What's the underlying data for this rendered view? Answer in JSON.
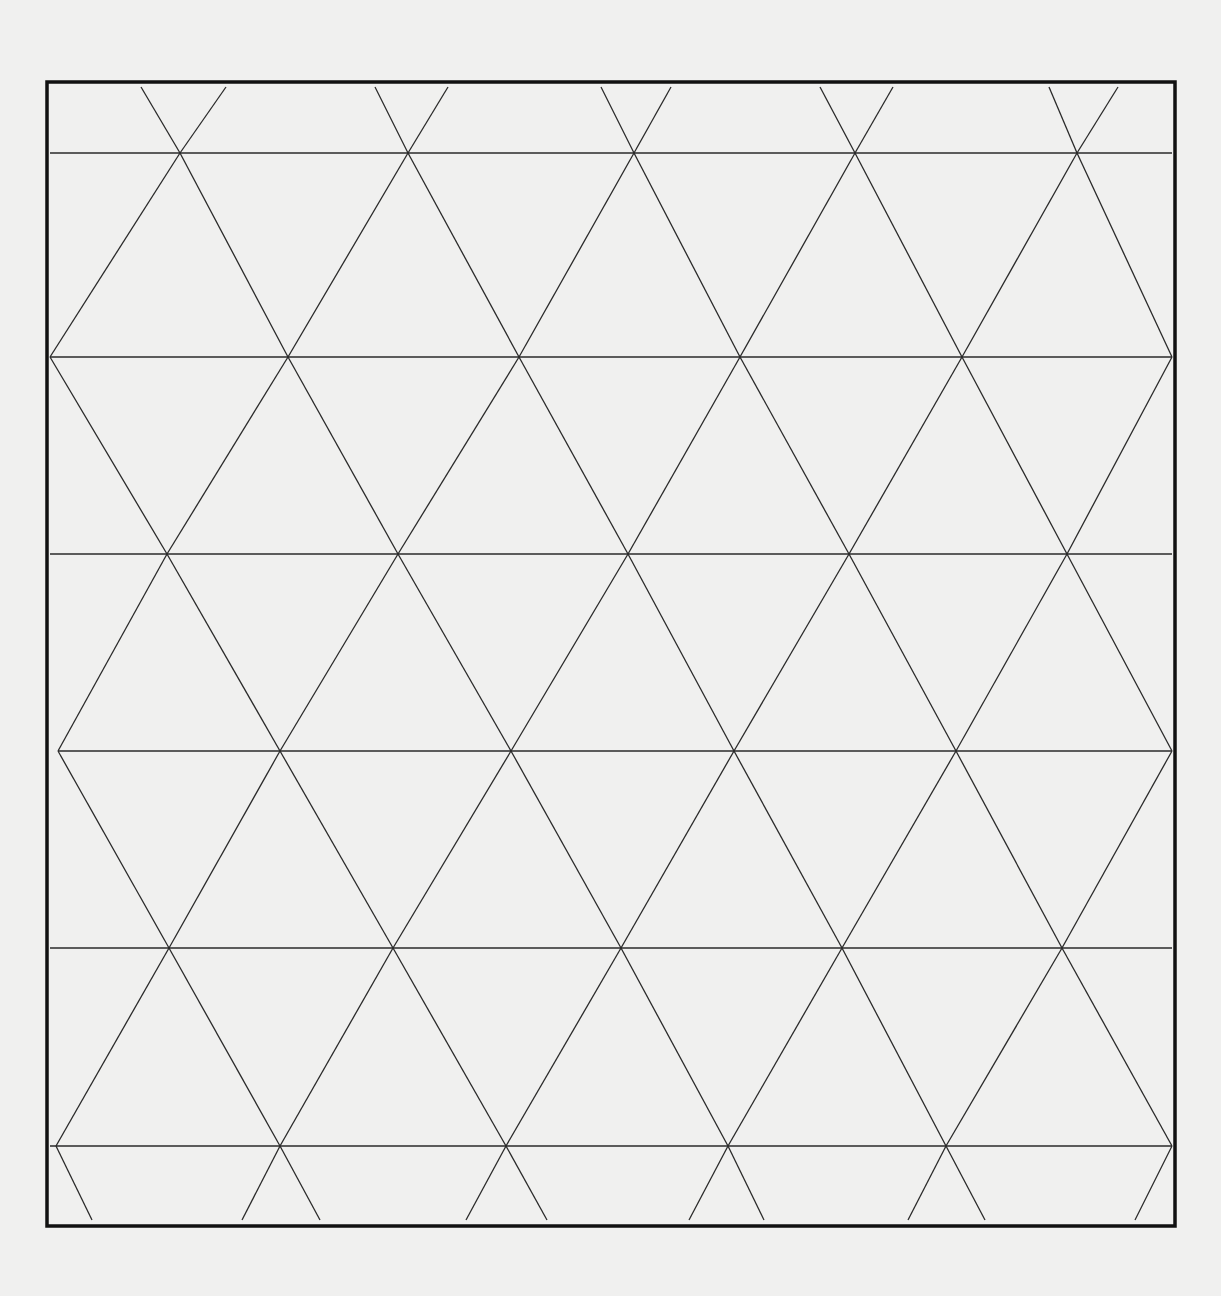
{
  "document": {
    "title": "Triangular grid paper",
    "paper_color": "#f0f0ef",
    "line_color": "#2a2a2a",
    "frame_color": "#111111"
  },
  "frame": {
    "x1": 47,
    "y1": 82,
    "x2": 1175,
    "y2": 1226,
    "stroke_width": 3.5
  },
  "grid": {
    "horizontal_lines": [
      {
        "y": 153,
        "x1": 50,
        "x2": 1172
      },
      {
        "y": 357,
        "x1": 50,
        "x2": 1172
      },
      {
        "y": 554,
        "x1": 50,
        "x2": 1172
      },
      {
        "y": 751,
        "x1": 58,
        "x2": 1172
      },
      {
        "y": 948,
        "x1": 50,
        "x2": 1172
      },
      {
        "y": 1146,
        "x1": 50,
        "x2": 1172
      }
    ],
    "vertex_rows": [
      {
        "y": 87,
        "x": [
          141,
          226,
          375,
          448,
          601,
          671,
          820,
          893,
          1049,
          1118
        ]
      },
      {
        "y": 153,
        "x": [
          180,
          408,
          634,
          855,
          1077
        ]
      },
      {
        "y": 357,
        "x": [
          50,
          288,
          519,
          740,
          962,
          1172
        ]
      },
      {
        "y": 554,
        "x": [
          167,
          398,
          628,
          849,
          1067
        ]
      },
      {
        "y": 751,
        "x": [
          58,
          280,
          511,
          734,
          956,
          1172
        ]
      },
      {
        "y": 948,
        "x": [
          169,
          393,
          621,
          842,
          1062
        ]
      },
      {
        "y": 1146,
        "x": [
          56,
          280,
          506,
          728,
          946,
          1172
        ]
      },
      {
        "y": 1220,
        "x": [
          92,
          242,
          320,
          466,
          547,
          689,
          764,
          908,
          985,
          1135
        ]
      }
    ]
  }
}
